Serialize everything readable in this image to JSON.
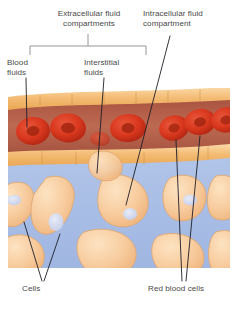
{
  "figure": {
    "type": "biology-diagram"
  },
  "labels": {
    "extracellular": "Extracellular fluid\ncompartments",
    "intracellular": "Intracellular fluid\ncompartment",
    "blood_fluids": "Blood\nfluids",
    "interstitial_fluids": "Interstitial\nfluids",
    "cells": "Cells",
    "red_blood_cells": "Red blood cells"
  },
  "colors": {
    "background": "#ffffff",
    "vessel_wall": "#f3ba72",
    "vessel_wall_light": "#f8d49c",
    "plasma": "#b05a44",
    "plasma_light": "#c0705a",
    "red_blood_cell": "#d9381e",
    "red_blood_cell_dark": "#9e2412",
    "interstitial_fluid": "#a9bee6",
    "tissue_cell": "#f6c99a",
    "tissue_cell_light": "#fbe0bd",
    "nucleus": "#ccd2ea",
    "leader_line": "#1e1e28",
    "bracket": "#8a8a8a",
    "text": "#4a4a4a"
  },
  "structures": {
    "vessel": {
      "name": "blood-vessel",
      "wall_segments_top": 7,
      "wall_segments_bottom": 7,
      "red_blood_cell_count": 7
    },
    "tissue": {
      "name": "tissue-region",
      "cell_count": 9
    }
  },
  "leader_lines": {
    "blood_fluids_target": "plasma",
    "interstitial_fluids_target": "interstitial-fluid",
    "intracellular_target": "tissue-cell",
    "cells_targets": 2,
    "red_blood_cells_targets": 2
  },
  "bracket": {
    "name": "extracellular-bracket",
    "left": 30,
    "right": 146,
    "stem_x": 88
  }
}
